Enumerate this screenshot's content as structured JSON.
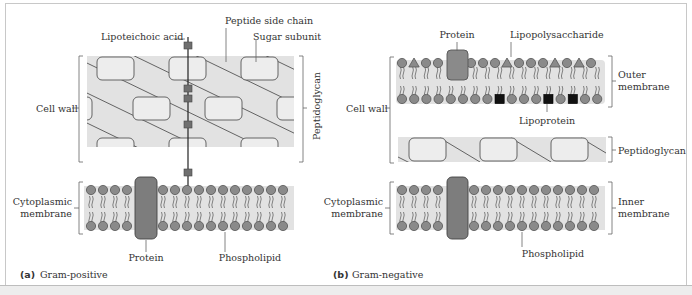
{
  "panel_a": {
    "caption_letter": "(a)",
    "caption_text": "Gram-positive",
    "labels": {
      "lipoteichoic_acid": "Lipoteichoic acid",
      "peptide_side_chain": "Peptide side chain",
      "sugar_subunit": "Sugar subunit",
      "cell_wall": "Cell wall",
      "peptidoglycan": "Peptidoglycan",
      "cytoplasmic_membrane_line1": "Cytoplasmic",
      "cytoplasmic_membrane_line2": "membrane",
      "protein": "Protein",
      "phospholipid": "Phospholipid"
    }
  },
  "panel_b": {
    "caption_letter": "(b)",
    "caption_text": "Gram-negative",
    "labels": {
      "protein": "Protein",
      "lipopolysaccharide": "Lipopolysaccharide",
      "outer_membrane_line1": "Outer",
      "outer_membrane_line2": "membrane",
      "cell_wall": "Cell wall",
      "lipoprotein": "Lipoprotein",
      "peptidoglycan": "Peptidoglycan",
      "cytoplasmic_membrane_line1": "Cytoplasmic",
      "cytoplasmic_membrane_line2": "membrane",
      "inner_membrane_line1": "Inner",
      "inner_membrane_line2": "membrane",
      "phospholipid": "Phospholipid"
    },
    "outer_membrane_top_heads": [
      "circle",
      "triangle",
      "circle",
      "circle",
      "protein",
      "circle",
      "circle",
      "circle",
      "triangle",
      "circle",
      "circle",
      "circle",
      "triangle",
      "circle",
      "triangle",
      "circle"
    ],
    "outer_membrane_bottom_heads": [
      "circle",
      "circle",
      "circle",
      "circle",
      "circle",
      "circle",
      "circle",
      "circle",
      "square",
      "circle",
      "circle",
      "circle",
      "square",
      "circle",
      "square",
      "circle",
      "circle"
    ]
  },
  "colors": {
    "background": "#ffffff",
    "wall_fill": "#e2e2e2",
    "sugar_fill": "#ededed",
    "head_fill": "#8a8a8a",
    "protein_fill": "#7d7d7d",
    "lipoprotein_fill": "#111111",
    "line": "#444444"
  }
}
